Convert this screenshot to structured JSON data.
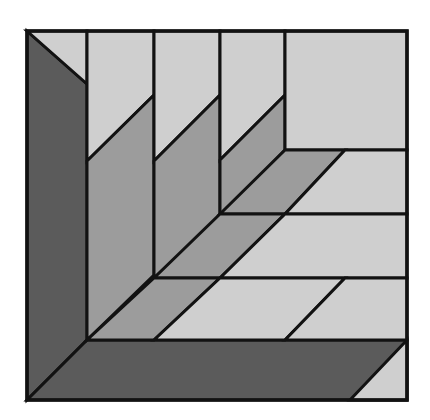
{
  "figure": {
    "type": "geometric-pattern",
    "background_color": "#ffffff",
    "outline_color": "#121212",
    "outline_width": 3,
    "canvas": {
      "width": 430,
      "height": 420
    },
    "frame": {
      "x": 27,
      "y": 31,
      "width": 380,
      "height": 369
    },
    "palette": {
      "dark": "#5b5b5b",
      "medium": "#9c9c9c",
      "light": "#cfcfcf"
    },
    "shapes": [
      {
        "name": "left-dark-column",
        "tone": "dark",
        "color": "#5b5b5b",
        "points": "27,31 87,84 87,340 27,400"
      },
      {
        "name": "top-left-light-triangle",
        "tone": "light",
        "color": "#cfcfcf",
        "points": "27,31 87,31 87,84"
      },
      {
        "name": "bottom-dark-band",
        "tone": "dark",
        "color": "#5b5b5b",
        "points": "27,400 87,340 407,340 407,400"
      },
      {
        "name": "bottom-right-light-triangle",
        "tone": "light",
        "color": "#cfcfcf",
        "points": "407,340 407,400 350,400"
      },
      {
        "name": "column-1-light-parallelogram",
        "tone": "light",
        "color": "#cfcfcf",
        "points": "87,31 154,31 154,95 87,161"
      },
      {
        "name": "column-1-medium-parallelogram",
        "tone": "medium",
        "color": "#9c9c9c",
        "points": "87,161 154,95 154,275 87,340"
      },
      {
        "name": "column-2-light-parallelogram",
        "tone": "light",
        "color": "#cfcfcf",
        "points": "154,31 220,31 220,95 154,161"
      },
      {
        "name": "column-2-medium-parallelogram",
        "tone": "medium",
        "color": "#9c9c9c",
        "points": "154,161 220,95 220,217 154,278"
      },
      {
        "name": "column-3-light-parallelogram",
        "tone": "light",
        "color": "#cfcfcf",
        "points": "220,31 285,31 285,95 220,160"
      },
      {
        "name": "column-3-medium-parallelogram",
        "tone": "medium",
        "color": "#9c9c9c",
        "points": "220,160 285,95 285,150 220,217"
      },
      {
        "name": "top-right-light-triangle",
        "tone": "light",
        "color": "#cfcfcf",
        "points": "285,31 407,31 407,150 285,150"
      },
      {
        "name": "row-1-medium-parallelogram",
        "tone": "medium",
        "color": "#9c9c9c",
        "points": "285,150 345,150 285,214 220,214"
      },
      {
        "name": "row-1-light-parallelogram",
        "tone": "light",
        "color": "#cfcfcf",
        "points": "345,150 407,150 407,214 285,214"
      },
      {
        "name": "row-2-medium-parallelogram",
        "tone": "medium",
        "color": "#9c9c9c",
        "points": "220,214 285,214 220,278 154,278"
      },
      {
        "name": "row-2-light-parallelogram",
        "tone": "light",
        "color": "#cfcfcf",
        "points": "285,214 407,214 407,278 220,278"
      },
      {
        "name": "row-3-medium-parallelogram",
        "tone": "medium",
        "color": "#9c9c9c",
        "points": "154,278 220,278 154,340 87,340"
      },
      {
        "name": "row-3-light-parallelogram",
        "tone": "light",
        "color": "#cfcfcf",
        "points": "220,278 345,278 285,340 154,340"
      },
      {
        "name": "row-4-light-parallelogram",
        "tone": "light",
        "color": "#cfcfcf",
        "points": "345,278 407,278 407,340 285,340"
      }
    ]
  }
}
